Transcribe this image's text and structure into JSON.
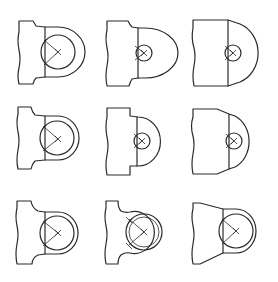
{
  "figure": {
    "description": "3x3 grid of technical drawing variants of a lug / clevis end (flat bar with rounded head and bore)",
    "stroke_color": "#2a2a2a",
    "background": "#ffffff",
    "rows": 3,
    "columns": 3,
    "shapes": [
      {
        "id": 1,
        "row": 1,
        "col": 1,
        "label": "lug-stepped-neck-large-bore"
      },
      {
        "id": 2,
        "row": 1,
        "col": 2,
        "label": "lug-stepped-neck-small-bore"
      },
      {
        "id": 3,
        "row": 1,
        "col": 3,
        "label": "lug-tapered-head-small-bore"
      },
      {
        "id": 4,
        "row": 2,
        "col": 1,
        "label": "lug-stepped-neck-large-bore-thin-wall"
      },
      {
        "id": 5,
        "row": 2,
        "col": 2,
        "label": "lug-stepped-neck-small-bore-short-head"
      },
      {
        "id": 6,
        "row": 2,
        "col": 3,
        "label": "lug-tapered-neck-small-bore"
      },
      {
        "id": 7,
        "row": 3,
        "col": 1,
        "label": "lug-curved-neck-large-bore"
      },
      {
        "id": 8,
        "row": 3,
        "col": 2,
        "label": "lug-curved-neck-ring-with-bushing"
      },
      {
        "id": 9,
        "row": 3,
        "col": 3,
        "label": "lug-tapered-body-large-bore"
      }
    ]
  }
}
